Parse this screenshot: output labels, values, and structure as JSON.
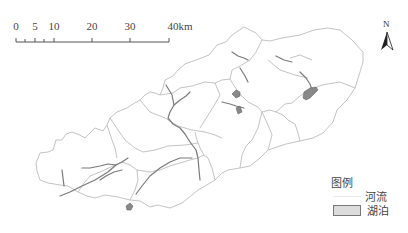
{
  "scale_bar": {
    "unit": "km",
    "ticks": [
      {
        "label": "0",
        "x": 16
      },
      {
        "label": "5",
        "x": 35
      },
      {
        "label": "10",
        "x": 54
      },
      {
        "label": "20",
        "x": 92
      },
      {
        "label": "30",
        "x": 130
      },
      {
        "label": "40km",
        "x": 172
      }
    ],
    "minor_ticks": [
      25,
      44
    ]
  },
  "north_arrow": {
    "label": "N"
  },
  "legend": {
    "title": "图例",
    "items": [
      {
        "label": "河流",
        "type": "line"
      },
      {
        "label": "湖泊",
        "type": "polygon"
      }
    ]
  },
  "colors": {
    "boundary": "#b4b4b4",
    "river": "#7a7a7a",
    "lake": "#888888"
  }
}
